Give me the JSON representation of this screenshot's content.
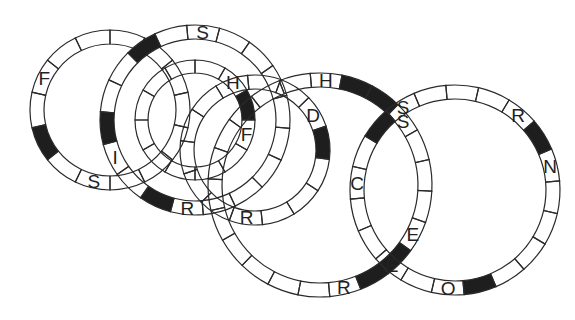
{
  "diagram": {
    "type": "interlocking-ring-word-puzzle",
    "colors": {
      "line": "#2a2a2a",
      "shaded": "#1e1e1e",
      "background": "#ffffff"
    },
    "rings": [
      {
        "id": "ring-1",
        "cx": 110,
        "cy": 110,
        "r": 80,
        "w": 14,
        "segments": 14,
        "start": -90,
        "shaded": [
          9
        ],
        "letters": [
          {
            "seg": 11,
            "ch": "F"
          },
          {
            "seg": 7,
            "ch": "S"
          }
        ]
      },
      {
        "id": "ring-2",
        "cx": 195,
        "cy": 120,
        "r": 95,
        "w": 14,
        "segments": 18,
        "start": -95,
        "shaded": [
          16,
          10,
          13
        ],
        "letters": [
          {
            "seg": 0,
            "ch": "S"
          },
          {
            "seg": 9,
            "ch": "R"
          },
          {
            "seg": 12,
            "ch": "I"
          }
        ]
      },
      {
        "id": "ring-3",
        "cx": 195,
        "cy": 120,
        "r": 60,
        "w": 13,
        "segments": 12,
        "start": -60,
        "shaded": [
          1
        ],
        "letters": [
          {
            "seg": 0,
            "ch": "H"
          },
          {
            "seg": 2,
            "ch": "F"
          }
        ]
      },
      {
        "id": "ring-4",
        "cx": 320,
        "cy": 185,
        "r": 112,
        "w": 14,
        "segments": 22,
        "start": -95,
        "shaded": [
          1,
          2,
          8,
          9
        ],
        "letters": [
          {
            "seg": 0,
            "ch": "H"
          },
          {
            "seg": 3,
            "ch": "S"
          },
          {
            "seg": 10,
            "ch": "R"
          },
          {
            "seg": 7,
            "ch": "E"
          }
        ]
      },
      {
        "id": "ring-5",
        "cx": 255,
        "cy": 150,
        "r": 75,
        "w": 14,
        "segments": 14,
        "start": -70,
        "shaded": [
          2
        ],
        "letters": [
          {
            "seg": 1,
            "ch": "D"
          },
          {
            "seg": 6,
            "ch": "R"
          }
        ]
      },
      {
        "id": "ring-6",
        "cx": 455,
        "cy": 190,
        "r": 105,
        "w": 14,
        "segments": 20,
        "start": -95,
        "shaded": [
          3,
          9,
          17
        ],
        "letters": [
          {
            "seg": 2,
            "ch": "R"
          },
          {
            "seg": 4,
            "ch": "N"
          },
          {
            "seg": 10,
            "ch": "O"
          },
          {
            "seg": 12,
            "ch": "E"
          },
          {
            "seg": 15,
            "ch": "C"
          },
          {
            "seg": 18,
            "ch": "S"
          }
        ]
      }
    ],
    "visible_letters": [
      "F",
      "S",
      "H",
      "F",
      "I",
      "S",
      "D",
      "R",
      "H",
      "R",
      "S",
      "C",
      "E",
      "R",
      "N",
      "O"
    ]
  }
}
